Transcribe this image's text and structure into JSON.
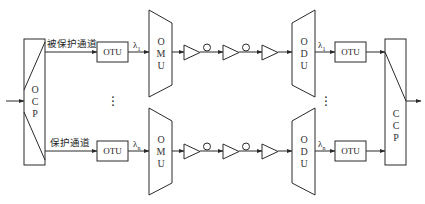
{
  "diagram": {
    "type": "optical 1+1 protection WDM system block diagram",
    "labels": {
      "protected_channel": "被保护通道",
      "protection_channel": "保护通道"
    },
    "blocks": {
      "ocp": [
        "O",
        "C",
        "P"
      ],
      "ccp": [
        "C",
        "C",
        "P"
      ],
      "omu": [
        "O",
        "M",
        "U"
      ],
      "odu": [
        "O",
        "D",
        "U"
      ],
      "otu": "OTU"
    },
    "wavelengths": {
      "lambda": "λ",
      "first_sub": "1",
      "nth_sub": "n"
    },
    "ellipsis": "⋮",
    "rows": [
      {
        "name": "protected",
        "tx_wavelength_sub": "1",
        "rx_wavelength_sub": "1"
      },
      {
        "name": "protection",
        "tx_wavelength_sub": "n",
        "rx_wavelength_sub": "n"
      }
    ],
    "colors": {
      "line": "#2a2a2a",
      "background": "#ffffff"
    }
  }
}
